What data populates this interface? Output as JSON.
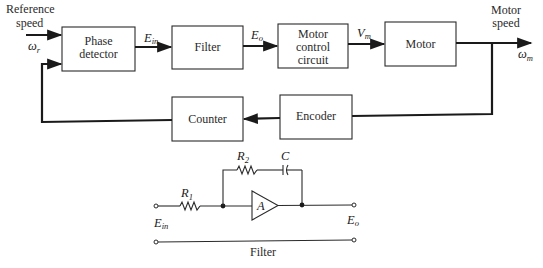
{
  "diagram": {
    "title": "Filter",
    "inputs": {
      "reference_label_line1": "Reference",
      "reference_label_line2": "speed",
      "reference_symbol": "ω",
      "reference_subscript": "r"
    },
    "outputs": {
      "motor_speed_line1": "Motor",
      "motor_speed_line2": "speed",
      "motor_symbol": "ω",
      "motor_subscript": "m"
    },
    "blocks": {
      "phase_detector": {
        "line1": "Phase",
        "line2": "detector"
      },
      "filter": {
        "line1": "Filter"
      },
      "motor_control": {
        "line1": "Motor",
        "line2": "control",
        "line3": "circuit"
      },
      "motor": {
        "line1": "Motor"
      },
      "encoder": {
        "line1": "Encoder"
      },
      "counter": {
        "line1": "Counter"
      }
    },
    "signals": {
      "e_in": {
        "symbol": "E",
        "subscript": "in"
      },
      "e_o": {
        "symbol": "E",
        "subscript": "o"
      },
      "v_m": {
        "symbol": "V",
        "subscript": "m"
      }
    },
    "circuit": {
      "r1": {
        "symbol": "R",
        "subscript": "1"
      },
      "r2": {
        "symbol": "R",
        "subscript": "2"
      },
      "c": {
        "symbol": "C"
      },
      "amp": {
        "symbol": "A"
      },
      "input": {
        "symbol": "E",
        "subscript": "in"
      },
      "output": {
        "symbol": "E",
        "subscript": "o"
      },
      "caption": "Filter"
    }
  }
}
